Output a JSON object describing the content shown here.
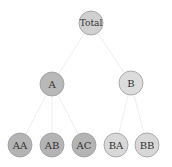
{
  "diagram": {
    "type": "tree",
    "nodes": [
      {
        "id": "Total",
        "label": "Total",
        "x": 91,
        "y": 23,
        "r": 12,
        "fill": "#d0d0d0"
      },
      {
        "id": "A",
        "label": "A",
        "x": 52,
        "y": 84,
        "r": 12,
        "fill": "#b8b8b8"
      },
      {
        "id": "B",
        "label": "B",
        "x": 131,
        "y": 83,
        "r": 12,
        "fill": "#dcdcdc"
      },
      {
        "id": "AA",
        "label": "AA",
        "x": 20,
        "y": 145,
        "r": 12,
        "fill": "#b4b4b4"
      },
      {
        "id": "AB",
        "label": "AB",
        "x": 52,
        "y": 145,
        "r": 12,
        "fill": "#b4b4b4"
      },
      {
        "id": "AC",
        "label": "AC",
        "x": 84,
        "y": 145,
        "r": 12,
        "fill": "#b4b4b4"
      },
      {
        "id": "BA",
        "label": "BA",
        "x": 116,
        "y": 145,
        "r": 12,
        "fill": "#d8d8d8"
      },
      {
        "id": "BB",
        "label": "BB",
        "x": 147,
        "y": 145,
        "r": 12,
        "fill": "#d8d8d8"
      }
    ],
    "edges": [
      {
        "from": "Total",
        "to": "A"
      },
      {
        "from": "Total",
        "to": "B"
      },
      {
        "from": "A",
        "to": "AA"
      },
      {
        "from": "A",
        "to": "AB"
      },
      {
        "from": "A",
        "to": "AC"
      },
      {
        "from": "B",
        "to": "BA"
      },
      {
        "from": "B",
        "to": "BB"
      }
    ],
    "colors": {
      "edge": "#eeeeee",
      "stroke": "#9a9a9a"
    }
  }
}
